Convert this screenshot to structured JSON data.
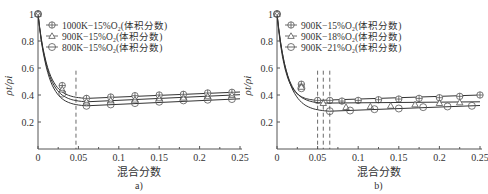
{
  "chart_data": [
    {
      "type": "line",
      "panel_label": "a)",
      "title": "",
      "xlabel": "混合分数",
      "ylabel": "ρt/ρi",
      "xlim": [
        0,
        0.25
      ],
      "ylim": [
        0,
        1
      ],
      "xticks": [
        "0",
        "0.05",
        "0.1",
        "0.15",
        "0.2",
        "0.25"
      ],
      "yticks": [
        "0.2",
        "0.4",
        "0.6",
        "0.8",
        "1"
      ],
      "legend_position": "upper center",
      "annotations": [
        {
          "type": "vline-dashed",
          "x": 0.047
        }
      ],
      "series": [
        {
          "name": "1000K−15%O₂(体积分数)",
          "marker": "circle-plus",
          "x": [
            0,
            0.03,
            0.06,
            0.09,
            0.12,
            0.15,
            0.18,
            0.21,
            0.24
          ],
          "y": [
            1.0,
            0.47,
            0.375,
            0.385,
            0.395,
            0.4,
            0.405,
            0.415,
            0.42
          ]
        },
        {
          "name": "900K−15%O₂(体积分数)",
          "marker": "triangle",
          "x": [
            0,
            0.03,
            0.06,
            0.09,
            0.12,
            0.15,
            0.18,
            0.21,
            0.24
          ],
          "y": [
            1.0,
            0.44,
            0.35,
            0.36,
            0.365,
            0.375,
            0.38,
            0.39,
            0.4
          ]
        },
        {
          "name": "800K−15%O₂(体积分数)",
          "marker": "circle",
          "x": [
            0,
            0.03,
            0.06,
            0.09,
            0.12,
            0.15,
            0.18,
            0.21,
            0.24
          ],
          "y": [
            1.0,
            0.41,
            0.32,
            0.33,
            0.34,
            0.35,
            0.36,
            0.365,
            0.37
          ]
        }
      ]
    },
    {
      "type": "line",
      "panel_label": "b)",
      "title": "",
      "xlabel": "混合分数",
      "ylabel": "ρt/ρi",
      "xlim": [
        0,
        0.25
      ],
      "ylim": [
        0,
        1
      ],
      "xticks": [
        "0",
        "0.05",
        "0.1",
        "0.15",
        "0.2",
        "0.25"
      ],
      "yticks": [
        "0.2",
        "0.4",
        "0.6",
        "0.8",
        "1"
      ],
      "legend_position": "upper center",
      "annotations": [
        {
          "type": "vline-dashed",
          "x": 0.05
        },
        {
          "type": "vline-dashed",
          "x": 0.057
        },
        {
          "type": "vline-dashed",
          "x": 0.065
        }
      ],
      "series": [
        {
          "name": "900K−15%O₂(体积分数)",
          "marker": "circle-plus",
          "x": [
            0,
            0.03,
            0.05,
            0.065,
            0.08,
            0.1,
            0.125,
            0.15,
            0.175,
            0.2,
            0.225,
            0.25
          ],
          "y": [
            1.0,
            0.48,
            0.36,
            0.36,
            0.355,
            0.36,
            0.365,
            0.37,
            0.375,
            0.38,
            0.39,
            0.4
          ]
        },
        {
          "name": "900K−18%O₂(体积分数)",
          "marker": "triangle",
          "x": [
            0,
            0.03,
            0.057,
            0.085,
            0.115,
            0.14,
            0.17,
            0.2,
            0.225
          ],
          "y": [
            1.0,
            0.46,
            0.34,
            0.31,
            0.315,
            0.32,
            0.33,
            0.34,
            0.345
          ]
        },
        {
          "name": "900K−21%O₂(体积分数)",
          "marker": "circle",
          "x": [
            0,
            0.03,
            0.065,
            0.09,
            0.12,
            0.15,
            0.18,
            0.21,
            0.24
          ],
          "y": [
            1.0,
            0.45,
            0.28,
            0.285,
            0.295,
            0.3,
            0.31,
            0.315,
            0.32
          ]
        }
      ]
    }
  ]
}
